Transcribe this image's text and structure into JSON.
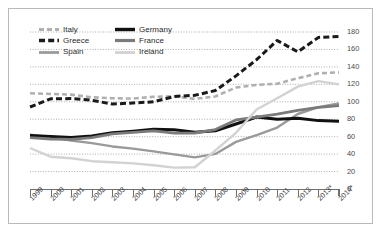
{
  "chart_data": {
    "type": "line",
    "title": "",
    "xlabel": "",
    "ylabel": "",
    "ylim": [
      0,
      180
    ],
    "ytick_step": 20,
    "grid": true,
    "legend_position": "top-left",
    "categories": [
      "1999",
      "2000",
      "2001",
      "2002",
      "2003",
      "2004",
      "2005",
      "2006",
      "2007",
      "2008",
      "2009",
      "2010",
      "2011",
      "2012",
      "2013*",
      "2014*"
    ],
    "yticks": [
      "0",
      "20",
      "40",
      "60",
      "80",
      "100",
      "120",
      "140",
      "160",
      "180"
    ],
    "series": [
      {
        "name": "Italy",
        "color": "#b0b0b0",
        "style": "dashed",
        "width": 2.6,
        "values": [
          109.7,
          109.0,
          108.2,
          105.1,
          104.1,
          103.7,
          105.7,
          106.3,
          103.3,
          106.1,
          116.4,
          119.3,
          120.7,
          127.0,
          132.6,
          133.7
        ]
      },
      {
        "name": "Greece",
        "color": "#1a1a1a",
        "style": "heavy-dash",
        "width": 3.0,
        "values": [
          94.0,
          103.4,
          103.7,
          101.7,
          97.4,
          98.6,
          100.0,
          106.1,
          107.4,
          112.9,
          129.7,
          148.3,
          170.3,
          157.2,
          173.8,
          174.9
        ]
      },
      {
        "name": "Spain",
        "color": "#9a9a9a",
        "style": "solid",
        "width": 2.4,
        "values": [
          62.4,
          59.4,
          55.6,
          52.6,
          48.8,
          46.3,
          43.2,
          39.7,
          36.3,
          40.2,
          54.0,
          61.7,
          70.5,
          86.0,
          93.9,
          98.1
        ]
      },
      {
        "name": "Germany",
        "color": "#111111",
        "style": "solid",
        "width": 3.0,
        "values": [
          61.3,
          60.2,
          59.1,
          60.7,
          64.4,
          66.2,
          68.5,
          68.0,
          65.2,
          66.8,
          74.5,
          82.5,
          80.0,
          81.0,
          78.4,
          77.8
        ]
      },
      {
        "name": "France",
        "color": "#7b7b7b",
        "style": "solid",
        "width": 2.8,
        "values": [
          58.9,
          57.3,
          56.9,
          59.0,
          63.2,
          65.0,
          66.7,
          64.0,
          64.2,
          68.2,
          79.2,
          82.4,
          85.8,
          90.2,
          93.5,
          95.6
        ]
      },
      {
        "name": "Ireland",
        "color": "#d2d2d2",
        "style": "solid",
        "width": 2.4,
        "values": [
          47.0,
          37.0,
          35.2,
          31.9,
          30.7,
          29.4,
          27.2,
          24.5,
          24.9,
          44.2,
          64.4,
          91.2,
          104.1,
          117.4,
          123.7,
          120.0
        ]
      }
    ]
  },
  "legend": {
    "items": [
      {
        "label": "Italy",
        "key": "italy"
      },
      {
        "label": "Germany",
        "key": "germany"
      },
      {
        "label": "Greece",
        "key": "greece"
      },
      {
        "label": "France",
        "key": "france"
      },
      {
        "label": "Spain",
        "key": "spain"
      },
      {
        "label": "Ireland",
        "key": "ireland"
      }
    ]
  }
}
